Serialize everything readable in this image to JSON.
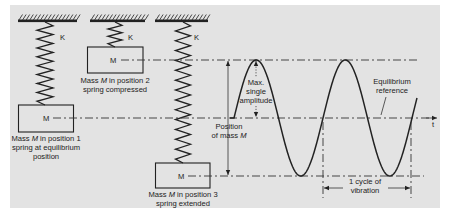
{
  "figure": {
    "springs": [
      {
        "constant_label": "K"
      },
      {
        "constant_label": "K"
      },
      {
        "constant_label": "K"
      }
    ],
    "masses": [
      {
        "symbol": "M",
        "caption": {
          "line1_pre": "Mass ",
          "line1_var": "M",
          "line1_post": " in position 1",
          "line2": "spring at equilibrium",
          "line3": "position"
        }
      },
      {
        "symbol": "M",
        "caption": {
          "line1_pre": "Mass ",
          "line1_var": "M",
          "line1_post": " in position 2",
          "line2": "spring compressed"
        }
      },
      {
        "symbol": "M",
        "caption": {
          "line1_pre": "Mass ",
          "line1_var": "M",
          "line1_post": " in position 3",
          "line2": "spring extended"
        }
      }
    ],
    "annotations": {
      "max_amplitude": [
        "Max.",
        "single",
        "amplitude"
      ],
      "position": {
        "line1": "Position",
        "line2_pre": "of mass ",
        "line2_var": "M"
      },
      "equilibrium": [
        "Equilibrium",
        "reference"
      ],
      "cycle": [
        "1 cycle of",
        "vibration"
      ],
      "time_axis": "t"
    },
    "waveform": {
      "type": "sine",
      "cycles_shown": 2
    }
  },
  "colors": {
    "panel": "#e3e3e3",
    "ink": "#222222"
  }
}
